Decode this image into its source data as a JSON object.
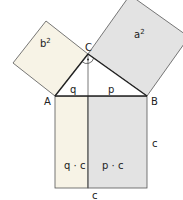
{
  "diagram": {
    "type": "pythagoras-cathetus-theorem",
    "colors": {
      "square_b": "#f7f3e6",
      "square_a": "#e3e3e3",
      "rect_q": "#f7f3e6",
      "rect_p": "#e3e3e3",
      "stroke": "#222222",
      "thin_stroke": "#555555"
    },
    "vertices": {
      "A": "A",
      "B": "B",
      "C": "C"
    },
    "labels": {
      "square_b": "b",
      "square_b_exp": "2",
      "square_a": "a",
      "square_a_exp": "2",
      "segment_q": "q",
      "segment_p": "p",
      "rect_q": "q · c",
      "rect_p": "p · c",
      "side_c_right": "c",
      "side_c_bottom": "c",
      "right_angle_marker": "·"
    }
  }
}
